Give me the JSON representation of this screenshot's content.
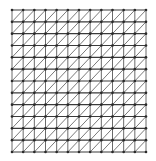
{
  "diagram": {
    "type": "triangular-mesh",
    "grid": {
      "columns": 12,
      "rows": 12,
      "origin_x": 12,
      "origin_y": 10,
      "width": 134,
      "height": 142
    },
    "colors": {
      "background": "#ffffff",
      "horizontal_edge": "#3a3a3a",
      "vertical_edge": "#6a6a6a",
      "diagonal_edge": "#7a7a7a",
      "node": "#2a2a2a"
    },
    "diagonal_direction": "bottom-left-to-top-right",
    "node_radius": 1.3
  }
}
